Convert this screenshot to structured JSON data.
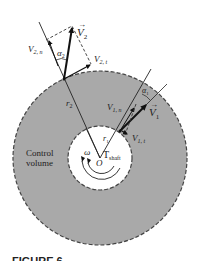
{
  "diagram": {
    "type": "control-volume-turbomachine",
    "colors": {
      "control_volume_fill": "#a9a9a9",
      "inner_fill": "#ffffff",
      "boundary": "#444444",
      "line": "#222222"
    },
    "labels": {
      "v2_vector": "V",
      "v2_sub": "2",
      "v2n": "V",
      "v2n_sub": "2, n",
      "v2t": "V",
      "v2t_sub": "2, t",
      "alpha2": "α",
      "alpha2_sub": "2",
      "r2": "r",
      "r2_sub": "2",
      "v1_vector": "V",
      "v1_sub": "1",
      "v1n": "V",
      "v1n_sub": "1, n",
      "v1t": "V",
      "v1t_sub": "1, t",
      "alpha1": "α",
      "alpha1_sub": "1",
      "r1": "r",
      "r1_sub": "1",
      "control_volume_line1": "Control",
      "control_volume_line2": "volume",
      "omega": "ω",
      "origin": "O",
      "torque": "T",
      "torque_sub": "shaft"
    },
    "caption": "FIGURE 6–34"
  }
}
